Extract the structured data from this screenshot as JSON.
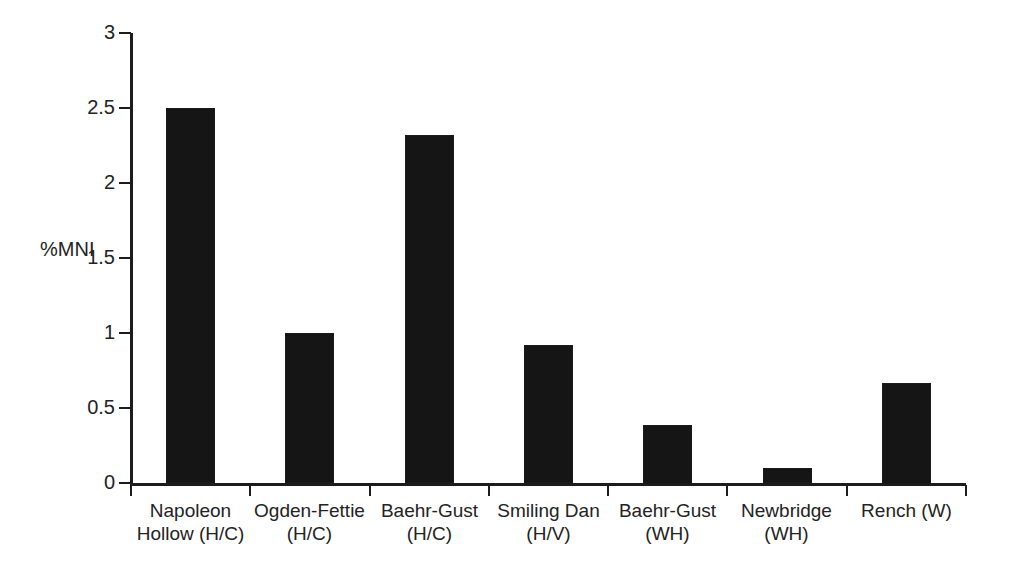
{
  "chart_data": {
    "type": "bar",
    "title": "",
    "xlabel": "",
    "ylabel": "%MNI",
    "categories": [
      "Napoleon\nHollow (H/C)",
      "Ogden-Fettie\n(H/C)",
      "Baehr-Gust\n(H/C)",
      "Smiling Dan\n(H/V)",
      "Baehr-Gust\n(WH)",
      "Newbridge\n(WH)",
      "Rench (W)"
    ],
    "values": [
      2.5,
      1.0,
      2.32,
      0.92,
      0.39,
      0.1,
      0.67
    ],
    "ylim": [
      0,
      3
    ],
    "ytick_labels": [
      "0",
      "0.5",
      "1",
      "1.5",
      "2",
      "2.5",
      "3"
    ],
    "ytick_values": [
      0,
      0.5,
      1,
      1.5,
      2,
      2.5,
      3
    ],
    "grid": false,
    "legend": "none",
    "bar_color": "#151515",
    "axis_color": "#1c1c1c",
    "background": "#ffffff"
  },
  "axis": {
    "y_title": "%MNI"
  }
}
